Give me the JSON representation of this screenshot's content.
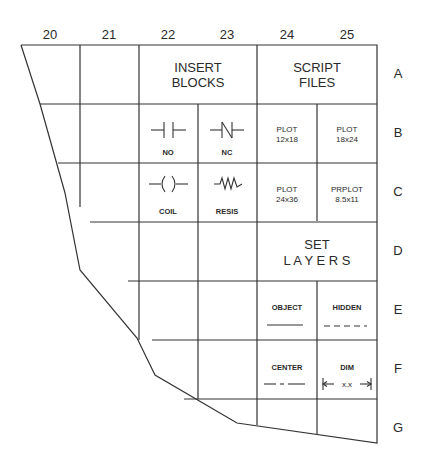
{
  "columns": [
    "20",
    "21",
    "22",
    "23",
    "24",
    "25"
  ],
  "rows": [
    "A",
    "B",
    "C",
    "D",
    "E",
    "F",
    "G"
  ],
  "cells": {
    "insert_blocks": {
      "line1": "INSERT",
      "line2": "BLOCKS"
    },
    "script_files": {
      "line1": "SCRIPT",
      "line2": "FILES"
    },
    "no": {
      "label": "NO",
      "icon": "normally-open-contact-icon"
    },
    "nc": {
      "label": "NC",
      "icon": "normally-closed-contact-icon"
    },
    "coil": {
      "label": "COIL",
      "icon": "coil-icon"
    },
    "resis": {
      "label": "RESIS",
      "icon": "resistor-icon"
    },
    "plot_12x18": {
      "line1": "PLOT",
      "line2": "12x18"
    },
    "plot_18x24": {
      "line1": "PLOT",
      "line2": "18x24"
    },
    "plot_24x36": {
      "line1": "PLOT",
      "line2": "24x36"
    },
    "prplot_8_5x11": {
      "line1": "PRPLOT",
      "line2": "8.5x11"
    },
    "set_layers": {
      "line1": "SET",
      "line2": "L A Y E R S"
    },
    "object": {
      "label": "OBJECT",
      "icon": "solid-line-icon"
    },
    "hidden": {
      "label": "HIDDEN",
      "icon": "dashed-line-icon"
    },
    "center": {
      "label": "CENTER",
      "icon": "center-line-icon"
    },
    "dim": {
      "label": "DIM",
      "dim_text": "x.x",
      "icon": "dimension-icon"
    }
  },
  "colors": {
    "line": "#333333",
    "text": "#2a2a2a",
    "background": "#ffffff"
  }
}
